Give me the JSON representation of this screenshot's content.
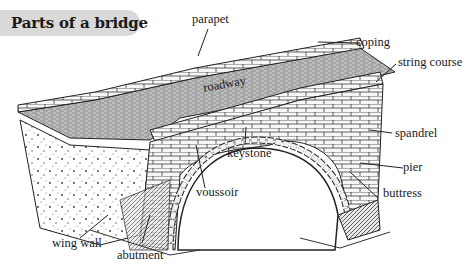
{
  "title": "Parts of a bridge",
  "labels": {
    "parapet": "parapet",
    "coping": "coping",
    "string_course": "string course",
    "roadway": "roadway",
    "keystone": "keystone",
    "spandrel": "spandrel",
    "pier": "pier",
    "buttress": "buttress",
    "voussoir": "voussoir",
    "wing_wall": "wing wall",
    "abutment": "abutment"
  },
  "colors": {
    "title_bg": "#d9d9d9",
    "ink": "#1a1a1a",
    "background": "#ffffff"
  }
}
